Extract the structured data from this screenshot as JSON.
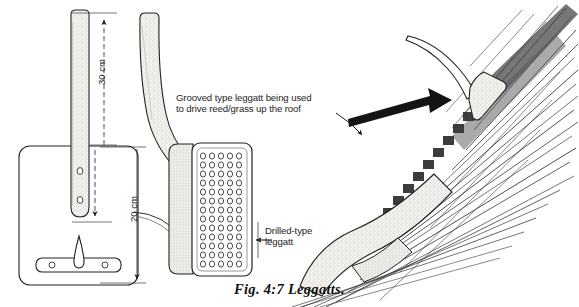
{
  "figure": {
    "caption": "Fig. 4:7 Leggatts.",
    "title_alt": "Leggatts"
  },
  "annotations": {
    "grooved": "Grooved type leggatt being used\nto drive reed/grass up the roof",
    "drilled": "Drilled-type\nleggatt"
  },
  "dimensions": {
    "handle_length": "30 cm",
    "plate_height": "20 cm"
  },
  "colors": {
    "background": "#ffffff",
    "ink": "#1a1a1a",
    "stipple": "#6f6f6f",
    "wood_fill": "#f4f2ee",
    "arrow": "#141414"
  },
  "parts": {
    "flat_leggatt_label": "flat drilled leggatt front view",
    "curved_leggatt_label": "curved handle leggatt side view",
    "roof_scene_label": "leggatt driving reed up roof"
  }
}
